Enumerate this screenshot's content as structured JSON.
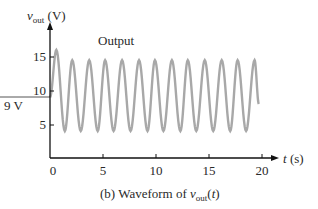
{
  "chart_data": {
    "type": "line",
    "title": "",
    "caption": "(b)  Waveform of v_out(t)",
    "xlabel": "t (s)",
    "ylabel": "v_out (V)",
    "xlim": [
      0,
      20
    ],
    "ylim": [
      0,
      17
    ],
    "xticks": [
      0,
      5,
      10,
      15,
      20
    ],
    "yticks": [
      5,
      10,
      15
    ],
    "grid": false,
    "legend": null,
    "annotations": [
      {
        "text": "Output",
        "x": 6.7,
        "y": 17.3
      },
      {
        "text": "9 V",
        "type": "horizontal-reference-line",
        "y": 9
      }
    ],
    "series": [
      {
        "name": "Output",
        "color": "#a8a8a8",
        "description": "Oscillation about 9 V; first peak ~16 V at t~0.6 s, subsequent peaks ~14.5 V, troughs ~4 V, period ~1.57 s, 13 peaks over 0-20 s, ends near 8 V at t=19.7 s",
        "x": [
          0,
          0.6,
          1.4,
          2.1,
          2.9,
          3.7,
          4.5,
          5.2,
          6.0,
          6.8,
          7.6,
          8.4,
          9.2,
          9.9,
          10.7,
          11.5,
          12.3,
          13.0,
          13.8,
          14.6,
          15.4,
          16.2,
          17.0,
          17.7,
          18.5,
          19.3,
          19.7
        ],
        "y": [
          9,
          16,
          4,
          14.5,
          4,
          14.5,
          4,
          14.5,
          4,
          14.5,
          4,
          14.5,
          4,
          14.5,
          4,
          14.5,
          4,
          14.5,
          4,
          14.5,
          4,
          14.5,
          4,
          14.5,
          4,
          14.5,
          8
        ]
      }
    ]
  },
  "axis": {
    "y_label_main": "v",
    "y_label_sub": "out",
    "y_label_unit": " (V)",
    "x_label_var": "t",
    "x_label_unit": " (s)",
    "y_tick_15": "15",
    "y_tick_10": "10",
    "y_tick_5": "5",
    "ref_label": "9 V",
    "x_tick_0": "0",
    "x_tick_5": "5",
    "x_tick_10": "10",
    "x_tick_15": "15",
    "x_tick_20": "20"
  },
  "annotation": {
    "output": "Output"
  },
  "caption": {
    "prefix": "(b)  Waveform of ",
    "var": "v",
    "sub": "out",
    "open": "(",
    "arg": "t",
    "close": ")"
  }
}
